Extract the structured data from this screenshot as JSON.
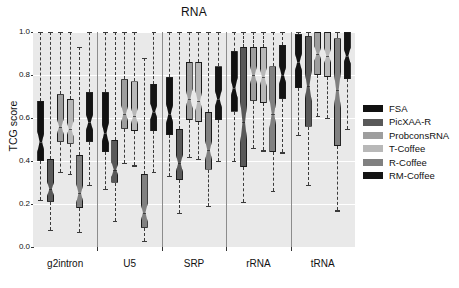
{
  "chart_data": {
    "type": "box",
    "title": "RNA",
    "xlabel": "",
    "ylabel": "TCG score",
    "ylim": [
      0.0,
      1.0
    ],
    "ytick_labels": [
      "0.0",
      "0.2",
      "0.4",
      "0.6",
      "0.8",
      "1.0"
    ],
    "ytick_values": [
      0.0,
      0.2,
      0.4,
      0.6,
      0.8,
      1.0
    ],
    "grid": "horizontal-white-on-gray",
    "legend_position": "right",
    "categories": [
      "g2intron",
      "U5",
      "SRP",
      "rRNA",
      "tRNA"
    ],
    "series": [
      {
        "name": "FSA",
        "color": "#111111",
        "boxes": [
          {
            "category": "g2intron",
            "whisker_low": 0.22,
            "q1": 0.4,
            "median": 0.49,
            "q3": 0.68,
            "whisker_high": 1.0
          },
          {
            "category": "U5",
            "whisker_low": 0.27,
            "q1": 0.44,
            "median": 0.53,
            "q3": 0.72,
            "whisker_high": 1.0
          },
          {
            "category": "SRP",
            "whisker_low": 0.33,
            "q1": 0.52,
            "median": 0.62,
            "q3": 0.79,
            "whisker_high": 1.0
          },
          {
            "category": "rRNA",
            "whisker_low": 0.4,
            "q1": 0.63,
            "median": 0.74,
            "q3": 0.91,
            "whisker_high": 1.0
          },
          {
            "category": "tRNA",
            "whisker_low": 0.52,
            "q1": 0.74,
            "median": 0.86,
            "q3": 0.99,
            "whisker_high": 1.0
          }
        ]
      },
      {
        "name": "PicXAA-R",
        "color": "#595959",
        "boxes": [
          {
            "category": "g2intron",
            "whisker_low": 0.08,
            "q1": 0.21,
            "median": 0.27,
            "q3": 0.41,
            "whisker_high": 1.0
          },
          {
            "category": "U5",
            "whisker_low": 0.12,
            "q1": 0.3,
            "median": 0.36,
            "q3": 0.5,
            "whisker_high": 1.0
          },
          {
            "category": "SRP",
            "whisker_low": 0.16,
            "q1": 0.31,
            "median": 0.39,
            "q3": 0.55,
            "whisker_high": 1.0
          },
          {
            "category": "rRNA",
            "whisker_low": 0.21,
            "q1": 0.37,
            "median": 0.58,
            "q3": 0.93,
            "whisker_high": 1.0
          },
          {
            "category": "tRNA",
            "whisker_low": 0.29,
            "q1": 0.56,
            "median": 0.75,
            "q3": 0.98,
            "whisker_high": 1.0
          }
        ]
      },
      {
        "name": "ProbconsRNA",
        "color": "#9e9e9e",
        "boxes": [
          {
            "category": "g2intron",
            "whisker_low": 0.35,
            "q1": 0.49,
            "median": 0.56,
            "q3": 0.71,
            "whisker_high": 1.0
          },
          {
            "category": "U5",
            "whisker_low": 0.39,
            "q1": 0.55,
            "median": 0.62,
            "q3": 0.78,
            "whisker_high": 1.0
          },
          {
            "category": "SRP",
            "whisker_low": 0.42,
            "q1": 0.59,
            "median": 0.69,
            "q3": 0.86,
            "whisker_high": 1.0
          },
          {
            "category": "rRNA",
            "whisker_low": 0.46,
            "q1": 0.68,
            "median": 0.8,
            "q3": 0.93,
            "whisker_high": 1.0
          },
          {
            "category": "tRNA",
            "whisker_low": 0.61,
            "q1": 0.8,
            "median": 0.9,
            "q3": 1.0,
            "whisker_high": 1.0
          }
        ]
      },
      {
        "name": "T-Coffee",
        "color": "#b8b8b8",
        "boxes": [
          {
            "category": "g2intron",
            "whisker_low": 0.34,
            "q1": 0.48,
            "median": 0.55,
            "q3": 0.69,
            "whisker_high": 1.0
          },
          {
            "category": "U5",
            "whisker_low": 0.38,
            "q1": 0.54,
            "median": 0.61,
            "q3": 0.77,
            "whisker_high": 1.0
          },
          {
            "category": "SRP",
            "whisker_low": 0.41,
            "q1": 0.58,
            "median": 0.68,
            "q3": 0.86,
            "whisker_high": 1.0
          },
          {
            "category": "rRNA",
            "whisker_low": 0.45,
            "q1": 0.67,
            "median": 0.79,
            "q3": 0.93,
            "whisker_high": 1.0
          },
          {
            "category": "tRNA",
            "whisker_low": 0.6,
            "q1": 0.79,
            "median": 0.89,
            "q3": 1.0,
            "whisker_high": 1.0
          }
        ]
      },
      {
        "name": "R-Coffee",
        "color": "#808080",
        "boxes": [
          {
            "category": "g2intron",
            "whisker_low": 0.07,
            "q1": 0.18,
            "median": 0.25,
            "q3": 0.43,
            "whisker_high": 0.93
          },
          {
            "category": "U5",
            "whisker_low": 0.03,
            "q1": 0.09,
            "median": 0.16,
            "q3": 0.34,
            "whisker_high": 0.88
          },
          {
            "category": "SRP",
            "whisker_low": 0.19,
            "q1": 0.36,
            "median": 0.45,
            "q3": 0.63,
            "whisker_high": 1.0
          },
          {
            "category": "rRNA",
            "whisker_low": 0.26,
            "q1": 0.44,
            "median": 0.62,
            "q3": 0.84,
            "whisker_high": 1.0
          },
          {
            "category": "tRNA",
            "whisker_low": 0.17,
            "q1": 0.47,
            "median": 0.73,
            "q3": 0.97,
            "whisker_high": 1.0
          }
        ]
      },
      {
        "name": "RM-Coffee",
        "color": "#141414",
        "boxes": [
          {
            "category": "g2intron",
            "whisker_low": 0.29,
            "q1": 0.49,
            "median": 0.58,
            "q3": 0.72,
            "whisker_high": 1.0
          },
          {
            "category": "U5",
            "whisker_low": 0.35,
            "q1": 0.54,
            "median": 0.63,
            "q3": 0.76,
            "whisker_high": 1.0
          },
          {
            "category": "SRP",
            "whisker_low": 0.4,
            "q1": 0.59,
            "median": 0.69,
            "q3": 0.84,
            "whisker_high": 1.0
          },
          {
            "category": "rRNA",
            "whisker_low": 0.44,
            "q1": 0.69,
            "median": 0.8,
            "q3": 0.94,
            "whisker_high": 1.0
          },
          {
            "category": "tRNA",
            "whisker_low": 0.55,
            "q1": 0.78,
            "median": 0.89,
            "q3": 1.0,
            "whisker_high": 1.0
          }
        ]
      }
    ]
  },
  "legend": {
    "items": [
      {
        "label": "FSA",
        "color": "#111111"
      },
      {
        "label": "PicXAA-R",
        "color": "#595959"
      },
      {
        "label": "ProbconsRNA",
        "color": "#9e9e9e"
      },
      {
        "label": "T-Coffee",
        "color": "#b8b8b8"
      },
      {
        "label": "R-Coffee",
        "color": "#808080"
      },
      {
        "label": "RM-Coffee",
        "color": "#141414"
      }
    ]
  }
}
